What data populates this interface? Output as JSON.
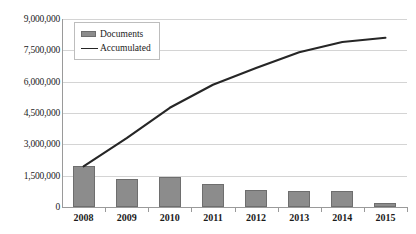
{
  "chart_data": {
    "type": "bar",
    "title": "",
    "subtitle": "",
    "xlabel": "",
    "ylabel": "",
    "categories": [
      "2008",
      "2009",
      "2010",
      "2011",
      "2012",
      "2013",
      "2014",
      "2015"
    ],
    "ylim": [
      0,
      9000000
    ],
    "y_ticks": [
      0,
      1500000,
      3000000,
      4500000,
      6000000,
      7500000,
      9000000
    ],
    "y_tick_labels": [
      "0",
      "1,500,000",
      "3,000,000",
      "4,500,000",
      "6,000,000",
      "7,500,000",
      "9,000,000"
    ],
    "grid": true,
    "legend_position": "top-left-inside",
    "series": [
      {
        "name": "Documents",
        "type": "bar",
        "color": "#8c8c8c",
        "values": [
          1950000,
          1350000,
          1450000,
          1100000,
          800000,
          760000,
          780000,
          200000
        ]
      },
      {
        "name": "Accumulated",
        "type": "line",
        "color": "#262626",
        "values": [
          1950000,
          3300000,
          4750000,
          5850000,
          6650000,
          7410000,
          7900000,
          8100000
        ]
      }
    ]
  },
  "legend": {
    "items": [
      {
        "label": "Documents",
        "marker": "bar-swatch"
      },
      {
        "label": "Accumulated",
        "marker": "line-swatch"
      }
    ]
  }
}
